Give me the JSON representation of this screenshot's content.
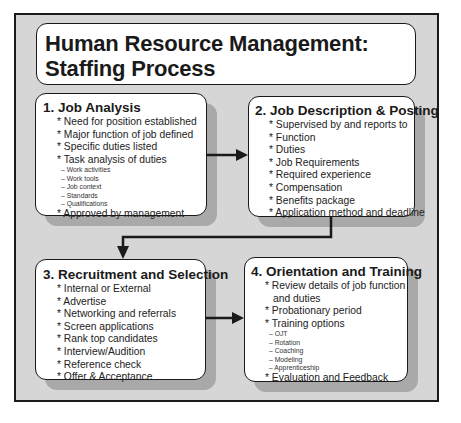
{
  "diagram": {
    "title_line1": "Human Resource Management:",
    "title_line2": "Staffing Process",
    "steps": [
      {
        "title": "1. Job Analysis",
        "items": [
          {
            "text": "* Need for position established"
          },
          {
            "text": "* Major function of job defined"
          },
          {
            "text": "* Specific duties listed"
          },
          {
            "text": "* Task analysis of duties"
          }
        ],
        "subitems": [
          "– Work activities",
          "– Work tools",
          "– Job context",
          "– Standards",
          "– Qualifications"
        ],
        "final_item": "* Approved by management"
      },
      {
        "title": "2. Job Description & Posting",
        "items": [
          "* Supervised by and reports to",
          "* Function",
          "* Duties",
          "* Job Requirements",
          "* Required experience",
          "* Compensation",
          "* Benefits package",
          "* Application method and deadline"
        ]
      },
      {
        "title": "3. Recruitment and Selection",
        "items": [
          "* Internal or External",
          "* Advertise",
          "* Networking and referrals",
          "* Screen applications",
          "* Rank top candidates",
          "* Interview/Audition",
          "* Reference check",
          "* Offer & Acceptance"
        ]
      },
      {
        "title": "4. Orientation and Training",
        "items": [
          "* Review details of job function",
          "and duties",
          "* Probationary period",
          "* Training options"
        ],
        "subitems": [
          "– OJT",
          "– Rotation",
          "– Coaching",
          "– Modeling",
          "– Apprenticeship"
        ],
        "final_item": "* Evaluation and Feedback"
      }
    ],
    "connectors": [
      {
        "from": "1. Job Analysis",
        "to": "2. Job Description & Posting",
        "style": "arrow-right"
      },
      {
        "from": "2. Job Description & Posting",
        "to": "3. Recruitment and Selection",
        "style": "elbow-arrow-down"
      },
      {
        "from": "3. Recruitment and Selection",
        "to": "4. Orientation and Training",
        "style": "arrow-right"
      }
    ],
    "colors": {
      "frame_bg": "#d6d6d6",
      "shadow": "#a9a9a9",
      "box_bg": "#ffffff",
      "line": "#1a1a1a"
    }
  }
}
